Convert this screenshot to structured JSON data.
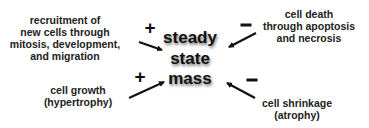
{
  "diagram": {
    "center": {
      "lines": [
        "steady",
        "state",
        "mass"
      ]
    },
    "inputs": [
      {
        "id": "recruitment",
        "effect": "+",
        "lines": [
          "recruitment of",
          "new cells through",
          "mitosis, development,",
          "and migration"
        ]
      },
      {
        "id": "cell-death",
        "effect": "–",
        "lines": [
          "cell death",
          "through apoptosis",
          "and necrosis"
        ]
      },
      {
        "id": "cell-growth",
        "effect": "+",
        "lines": [
          "cell growth",
          "(hypertrophy)"
        ]
      },
      {
        "id": "cell-shrinkage",
        "effect": "–",
        "lines": [
          "cell shrinkage",
          "(atrophy)"
        ]
      }
    ],
    "colors": {
      "text": "#222222",
      "arrow": "#111111",
      "background": "#ffffff"
    }
  }
}
